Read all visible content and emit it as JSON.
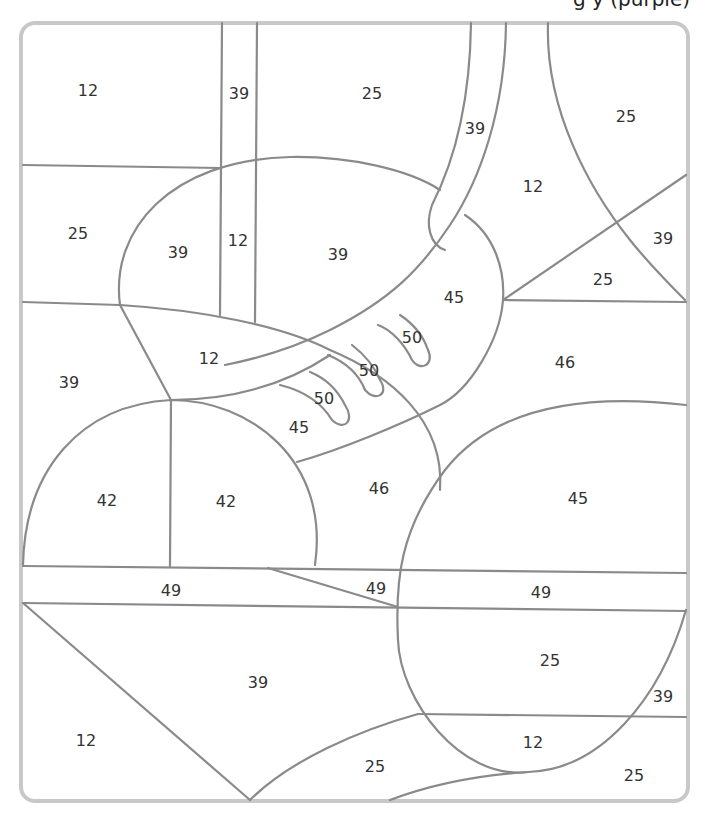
{
  "caption": {
    "text": "g              y                        (purple)"
  },
  "colors": {
    "stroke": "#8a8a8a",
    "border": "#c8c8c8",
    "text": "#333333"
  },
  "regions": [
    {
      "label": "12",
      "x": 88,
      "y": 90
    },
    {
      "label": "39",
      "x": 239,
      "y": 93
    },
    {
      "label": "25",
      "x": 372,
      "y": 93
    },
    {
      "label": "39",
      "x": 475,
      "y": 128
    },
    {
      "label": "25",
      "x": 626,
      "y": 116
    },
    {
      "label": "12",
      "x": 533,
      "y": 186
    },
    {
      "label": "25",
      "x": 78,
      "y": 233
    },
    {
      "label": "39",
      "x": 178,
      "y": 252
    },
    {
      "label": "12",
      "x": 238,
      "y": 240
    },
    {
      "label": "39",
      "x": 338,
      "y": 254
    },
    {
      "label": "39",
      "x": 663,
      "y": 238
    },
    {
      "label": "25",
      "x": 603,
      "y": 279
    },
    {
      "label": "45",
      "x": 454,
      "y": 297
    },
    {
      "label": "50",
      "x": 412,
      "y": 337
    },
    {
      "label": "12",
      "x": 209,
      "y": 358
    },
    {
      "label": "50",
      "x": 369,
      "y": 370
    },
    {
      "label": "46",
      "x": 565,
      "y": 362
    },
    {
      "label": "39",
      "x": 69,
      "y": 382
    },
    {
      "label": "50",
      "x": 324,
      "y": 398
    },
    {
      "label": "45",
      "x": 299,
      "y": 427
    },
    {
      "label": "46",
      "x": 379,
      "y": 488
    },
    {
      "label": "45",
      "x": 578,
      "y": 498
    },
    {
      "label": "42",
      "x": 107,
      "y": 500
    },
    {
      "label": "42",
      "x": 226,
      "y": 501
    },
    {
      "label": "49",
      "x": 171,
      "y": 590
    },
    {
      "label": "49",
      "x": 376,
      "y": 588
    },
    {
      "label": "49",
      "x": 541,
      "y": 592
    },
    {
      "label": "25",
      "x": 550,
      "y": 660
    },
    {
      "label": "39",
      "x": 258,
      "y": 682
    },
    {
      "label": "39",
      "x": 663,
      "y": 696
    },
    {
      "label": "12",
      "x": 86,
      "y": 740
    },
    {
      "label": "12",
      "x": 533,
      "y": 742
    },
    {
      "label": "25",
      "x": 375,
      "y": 766
    },
    {
      "label": "25",
      "x": 634,
      "y": 775
    }
  ]
}
